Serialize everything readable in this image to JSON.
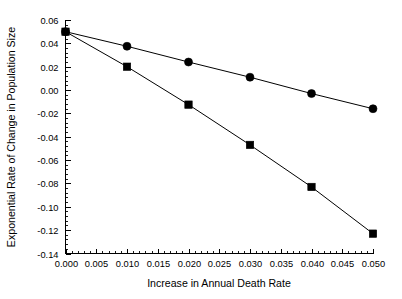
{
  "chart_data": {
    "type": "line",
    "title": "",
    "subtitle": "",
    "xlabel": "Increase in Annual Death Rate",
    "ylabel": "Exponential Rate of Change in Population Size",
    "x": [
      0.0,
      0.01,
      0.02,
      0.03,
      0.04,
      0.05
    ],
    "series": [
      {
        "name": "circle-series",
        "marker": "circle",
        "values": [
          0.05,
          0.0375,
          0.024,
          0.011,
          -0.003,
          -0.016
        ]
      },
      {
        "name": "square-series",
        "marker": "square",
        "values": [
          0.05,
          0.02,
          -0.0125,
          -0.047,
          -0.083,
          -0.123
        ]
      }
    ],
    "xlim": [
      0.0,
      0.05
    ],
    "ylim": [
      -0.14,
      0.06
    ],
    "xticks": [
      0.0,
      0.005,
      0.01,
      0.015,
      0.02,
      0.025,
      0.03,
      0.035,
      0.04,
      0.045,
      0.05
    ],
    "xticklabels": [
      "0.000",
      "0.005",
      "0.010",
      "0.015",
      "0.020",
      "0.025",
      "0.030",
      "0.035",
      "0.040",
      "0.045",
      "0.050"
    ],
    "yticks": [
      0.06,
      0.04,
      0.02,
      0.0,
      -0.02,
      -0.04,
      -0.06,
      -0.08,
      -0.1,
      -0.12,
      -0.14
    ],
    "yticklabels": [
      "0.06",
      "0.04",
      "0.02",
      "0.00",
      "-0.02",
      "-0.04",
      "-0.06",
      "-0.08",
      "-0.10",
      "-0.12",
      "-0.14"
    ],
    "grid": false,
    "legend": false,
    "legend_position": "none",
    "colors": {
      "line": "#000000",
      "marker": "#000000",
      "axis": "#000000",
      "background": "#ffffff"
    }
  }
}
